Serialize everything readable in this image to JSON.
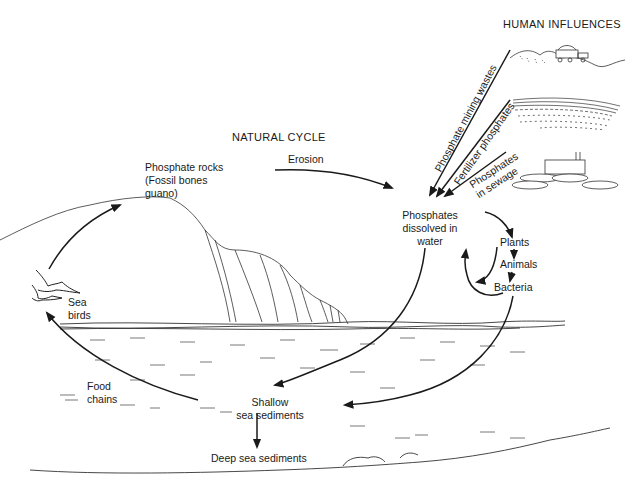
{
  "diagram": {
    "title_natural": "NATURAL CYCLE",
    "title_human": "HUMAN INFLUENCES",
    "nodes": {
      "phosphate_rocks": [
        "Phosphate rocks",
        "(Fossil bones",
        "guano)"
      ],
      "erosion": "Erosion",
      "dissolved": [
        "Phosphates",
        "dissolved in",
        "water"
      ],
      "plants": "Plants",
      "animals": "Animals",
      "bacteria": "Bacteria",
      "sea_birds": [
        "Sea",
        "birds"
      ],
      "food_chains": [
        "Food",
        "chains"
      ],
      "shallow": [
        "Shallow",
        "sea sediments"
      ],
      "deep": "Deep sea sediments"
    },
    "human_inputs": {
      "mining": "Phosphate mining wastes",
      "fertilizer": "Fertilizer phosphates",
      "sewage": [
        "Phosphates",
        "in sewage"
      ]
    },
    "icons": [
      "mining-truck-icon",
      "farm-field-icon",
      "sewage-plant-icon",
      "sea-bird-icon",
      "cliff-illustration"
    ],
    "colors": {
      "ink": "#1a1a1a",
      "background": "#ffffff"
    }
  }
}
